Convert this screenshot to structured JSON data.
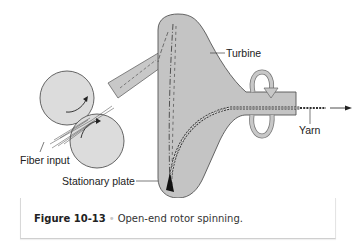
{
  "figure": {
    "labels": {
      "turbine": "Turbine",
      "yarn": "Yarn",
      "fiber_input": "Fiber input",
      "stationary_plate": "Stationary plate"
    },
    "caption": {
      "number": "Figure 10-13",
      "separator": "•",
      "text": "Open-end rotor spinning."
    },
    "colors": {
      "turbine_fill": "#c4c4c4",
      "turbine_stroke": "#555555",
      "roller_fill": "#dcdcdc",
      "arrow_fill": "#bdbdbd",
      "fiber": "#333333"
    }
  }
}
